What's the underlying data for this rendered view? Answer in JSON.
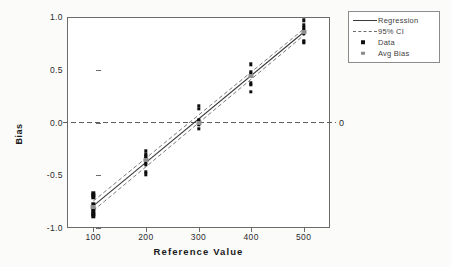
{
  "chart_data": {
    "type": "scatter",
    "title": "",
    "xlabel": "Reference Value",
    "ylabel": "Bias",
    "xlim": [
      50,
      550
    ],
    "ylim": [
      -1.0,
      1.0
    ],
    "xticks": [
      100,
      200,
      300,
      400,
      500
    ],
    "xticklabels": [
      "100",
      "200",
      "300",
      "400",
      "500"
    ],
    "yticks": [
      -1.0,
      -0.5,
      0.0,
      0.5,
      1.0
    ],
    "yticklabels": [
      "-1.0",
      "-0.5",
      "0.0",
      "0.5",
      "1.0"
    ],
    "grid": false,
    "legend_position": "upper right outside",
    "legend_entries": [
      {
        "label": "Regression",
        "style": "solid-line",
        "color": "#3a3a3a"
      },
      {
        "label": "95% CI",
        "style": "dashed-line",
        "color": "#6b6b6b"
      },
      {
        "label": "Data",
        "style": "square-marker",
        "color": "#0d0d0d"
      },
      {
        "label": "Avg Bias",
        "style": "square-marker",
        "color": "#8f8f8f"
      }
    ],
    "reference_line": {
      "y": 0.0,
      "style": "dashed",
      "label": "0"
    },
    "series": [
      {
        "name": "Data",
        "marker": "square",
        "color": "#0d0d0d",
        "points": [
          {
            "x": 100,
            "y": -0.67
          },
          {
            "x": 100,
            "y": -0.69
          },
          {
            "x": 100,
            "y": -0.71
          },
          {
            "x": 100,
            "y": -0.77
          },
          {
            "x": 100,
            "y": -0.81
          },
          {
            "x": 100,
            "y": -0.83
          },
          {
            "x": 100,
            "y": -0.85
          },
          {
            "x": 100,
            "y": -0.87
          },
          {
            "x": 100,
            "y": -0.89
          },
          {
            "x": 200,
            "y": -0.27
          },
          {
            "x": 200,
            "y": -0.3
          },
          {
            "x": 200,
            "y": -0.32
          },
          {
            "x": 200,
            "y": -0.34
          },
          {
            "x": 200,
            "y": -0.36
          },
          {
            "x": 200,
            "y": -0.38
          },
          {
            "x": 200,
            "y": -0.4
          },
          {
            "x": 200,
            "y": -0.47
          },
          {
            "x": 200,
            "y": -0.49
          },
          {
            "x": 300,
            "y": 0.16
          },
          {
            "x": 300,
            "y": 0.13
          },
          {
            "x": 300,
            "y": 0.02
          },
          {
            "x": 300,
            "y": 0.01
          },
          {
            "x": 300,
            "y": 0.0
          },
          {
            "x": 300,
            "y": -0.01
          },
          {
            "x": 300,
            "y": -0.02
          },
          {
            "x": 300,
            "y": -0.06
          },
          {
            "x": 400,
            "y": 0.55
          },
          {
            "x": 400,
            "y": 0.48
          },
          {
            "x": 400,
            "y": 0.46
          },
          {
            "x": 400,
            "y": 0.44
          },
          {
            "x": 400,
            "y": 0.37
          },
          {
            "x": 400,
            "y": 0.36
          },
          {
            "x": 400,
            "y": 0.29
          },
          {
            "x": 500,
            "y": 0.97
          },
          {
            "x": 500,
            "y": 0.92
          },
          {
            "x": 500,
            "y": 0.9
          },
          {
            "x": 500,
            "y": 0.88
          },
          {
            "x": 500,
            "y": 0.84
          },
          {
            "x": 500,
            "y": 0.77
          },
          {
            "x": 500,
            "y": 0.76
          }
        ]
      },
      {
        "name": "Avg Bias",
        "marker": "square",
        "color": "#8f8f8f",
        "points": [
          {
            "x": 100,
            "y": -0.8
          },
          {
            "x": 200,
            "y": -0.36
          },
          {
            "x": 300,
            "y": 0.0
          },
          {
            "x": 400,
            "y": 0.44
          },
          {
            "x": 500,
            "y": 0.86
          }
        ]
      }
    ],
    "lines": [
      {
        "name": "Regression",
        "style": "solid",
        "color": "#3a3a3a",
        "endpoints": [
          {
            "x": 100,
            "y": -0.79
          },
          {
            "x": 500,
            "y": 0.855
          }
        ]
      },
      {
        "name": "95% CI upper",
        "style": "dashed",
        "color": "#6b6b6b",
        "endpoints": [
          {
            "x": 100,
            "y": -0.745
          },
          {
            "x": 500,
            "y": 0.885
          }
        ]
      },
      {
        "name": "95% CI lower",
        "style": "dashed",
        "color": "#6b6b6b",
        "endpoints": [
          {
            "x": 100,
            "y": -0.835
          },
          {
            "x": 500,
            "y": 0.825
          }
        ]
      }
    ]
  }
}
